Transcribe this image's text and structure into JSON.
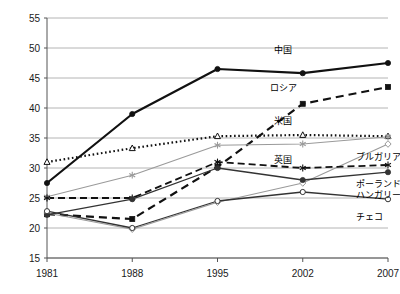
{
  "chart_data": {
    "type": "line",
    "title": "",
    "xlabel": "",
    "ylabel": "",
    "categories": [
      "1981",
      "1988",
      "1995",
      "2002",
      "2007"
    ],
    "x_tick_labels": [
      "1981",
      "1988",
      "1995",
      "2002",
      "2007"
    ],
    "y_tick_labels": [
      "15",
      "20",
      "25",
      "30",
      "35",
      "40",
      "45",
      "50",
      "55"
    ],
    "y_ticks": [
      15,
      20,
      25,
      30,
      35,
      40,
      45,
      50,
      55
    ],
    "ylim": [
      15,
      55
    ],
    "grid": "horizontal",
    "legend_position": "inline-right",
    "series": [
      {
        "name": "中国",
        "label": "中国",
        "values": [
          27.5,
          39.0,
          46.5,
          45.8,
          47.5
        ],
        "style": "solid",
        "color": "#111111",
        "width": 2.2,
        "marker": "circle",
        "label_x": 283,
        "label_y": 53,
        "label_anchor": "middle"
      },
      {
        "name": "ロシア",
        "label": "ロシア",
        "values": [
          22.3,
          21.5,
          30.2,
          40.7,
          43.5
        ],
        "style": "dashed",
        "color": "#111111",
        "width": 2.2,
        "marker": "square",
        "label_x": 283,
        "label_y": 91,
        "label_anchor": "middle"
      },
      {
        "name": "米国",
        "label": "米国",
        "values": [
          31.0,
          33.3,
          35.3,
          35.5,
          35.3
        ],
        "style": "dotted",
        "color": "#111111",
        "width": 2.2,
        "marker": "triangle",
        "label_x": 283,
        "label_y": 124,
        "label_anchor": "middle"
      },
      {
        "name": "英国",
        "label": "英国",
        "values": [
          25.2,
          28.8,
          33.8,
          34.0,
          35.2
        ],
        "style": "solid",
        "color": "#9a9a9a",
        "width": 1.1,
        "marker": "star",
        "label_x": 283,
        "label_y": 163,
        "label_anchor": "middle"
      },
      {
        "name": "ブルガリア",
        "label": "ブルガリア",
        "values": [
          22.5,
          19.8,
          24.3,
          27.5,
          34.0
        ],
        "style": "solid",
        "color": "#9a9a9a",
        "width": 1.1,
        "marker": "diamond",
        "label_x": 356,
        "label_y": 160,
        "label_anchor": "start"
      },
      {
        "name": "ポーランド",
        "label": "ポーランド",
        "values": [
          25.0,
          25.0,
          31.0,
          30.0,
          30.5
        ],
        "style": "dashed",
        "color": "#111111",
        "width": 1.8,
        "marker": "star",
        "label_x": 356,
        "label_y": 187,
        "label_anchor": "start"
      },
      {
        "name": "ハンガリー",
        "label": "ハンガリー",
        "values": [
          22.2,
          24.8,
          30.0,
          28.0,
          29.3
        ],
        "style": "solid",
        "color": "#333333",
        "width": 1.3,
        "marker": "circle",
        "label_x": 356,
        "label_y": 198,
        "label_anchor": "start"
      },
      {
        "name": "チェコ",
        "label": "チェコ",
        "values": [
          22.8,
          20.0,
          24.5,
          26.0,
          24.8
        ],
        "style": "solid",
        "color": "#333333",
        "width": 1.3,
        "marker": "circle-open",
        "label_x": 356,
        "label_y": 220,
        "label_anchor": "start"
      }
    ]
  },
  "axes": {
    "grid_color": "#b4b4b4",
    "axis_color": "#555555",
    "plot_left": 47,
    "plot_right": 388,
    "plot_top": 18,
    "plot_bottom": 258
  }
}
